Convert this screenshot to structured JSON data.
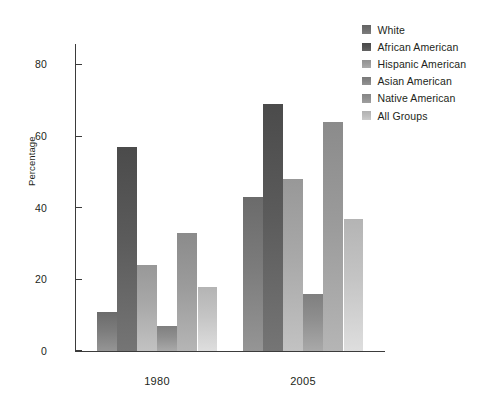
{
  "chart_data": {
    "type": "bar",
    "title": "",
    "subtitle": "",
    "xlabel": "",
    "ylabel": "Percentage",
    "categories": [
      "1980",
      "2005"
    ],
    "ylim": [
      0,
      86
    ],
    "yticks": [
      0,
      20,
      40,
      60,
      80
    ],
    "ytick_labels": [
      "0",
      "20",
      "40",
      "60",
      "80"
    ],
    "grid": false,
    "legend_position": "right",
    "grouped": true,
    "series": [
      {
        "name": "White",
        "color": "#7b7b7b",
        "values": [
          11,
          43
        ]
      },
      {
        "name": "African American",
        "color": "#5b5b5b",
        "values": [
          57,
          69
        ]
      },
      {
        "name": "Hispanic American",
        "color": "#a8a8a8",
        "values": [
          24,
          48
        ]
      },
      {
        "name": "Asian American",
        "color": "#8f8f8f",
        "values": [
          7,
          16
        ]
      },
      {
        "name": "Native American",
        "color": "#9b9b9b",
        "values": [
          33,
          64
        ]
      },
      {
        "name": "All Groups",
        "color": "#c4c4c4",
        "values": [
          18,
          37
        ]
      }
    ]
  },
  "legend": {
    "items": [
      {
        "label": "White",
        "swatch": "#6f6f6f"
      },
      {
        "label": "African American",
        "swatch": "#555555"
      },
      {
        "label": "Hispanic American",
        "swatch": "#9e9e9e"
      },
      {
        "label": "Asian American",
        "swatch": "#858585"
      },
      {
        "label": "Native American",
        "swatch": "#919191"
      },
      {
        "label": "All Groups",
        "swatch": "#bdbdbd"
      }
    ]
  },
  "axes": {
    "y_title": "Percentage",
    "y_tick_labels": [
      "80",
      "60",
      "40",
      "20",
      "0"
    ],
    "x_tick_labels": [
      "1980",
      "2005"
    ]
  }
}
